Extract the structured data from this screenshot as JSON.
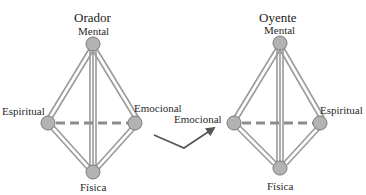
{
  "colors": {
    "node_fill": "#b3b3b3",
    "node_stroke": "#7a7a7a",
    "line": "#9a9a9a",
    "dash": "#8c8c8c",
    "arrow": "#555555",
    "text": "#2a2a2a"
  },
  "diagrams": [
    {
      "title": "Orador",
      "nodes": [
        {
          "id": "mental",
          "label": "Mental"
        },
        {
          "id": "espiritual",
          "label": "Espiritual"
        },
        {
          "id": "emocional",
          "label": "Emocional"
        },
        {
          "id": "fisica",
          "label": "Física"
        }
      ]
    },
    {
      "title": "Oyente",
      "nodes": [
        {
          "id": "mental",
          "label": "Mental"
        },
        {
          "id": "emocional",
          "label": "Emocional"
        },
        {
          "id": "espiritual",
          "label": "Espiritual"
        },
        {
          "id": "fisica",
          "label": "Física"
        }
      ]
    }
  ],
  "connector": {
    "type": "arrow",
    "from": "Orador",
    "to": "Oyente.Emocional"
  }
}
